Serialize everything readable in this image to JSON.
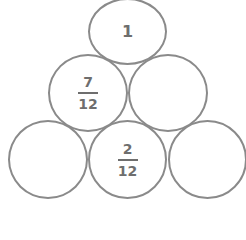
{
  "pyramid": {
    "stroke_color": "#8a8a8a",
    "text_color": "#6e6e6e",
    "rows": [
      {
        "cells": [
          {
            "type": "whole",
            "value": "1"
          }
        ]
      },
      {
        "cells": [
          {
            "type": "fraction",
            "numerator": "7",
            "denominator": "12"
          },
          {
            "type": "empty"
          }
        ]
      },
      {
        "cells": [
          {
            "type": "empty"
          },
          {
            "type": "fraction",
            "numerator": "2",
            "denominator": "12"
          },
          {
            "type": "empty"
          }
        ]
      }
    ]
  }
}
